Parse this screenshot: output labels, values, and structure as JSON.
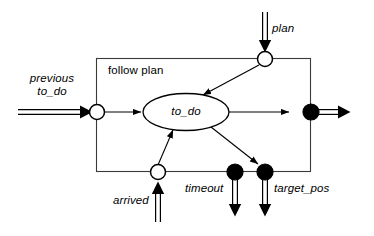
{
  "diagram": {
    "type": "dataflow-state-diagram",
    "container": {
      "name": "follow plan",
      "label": "follow plan",
      "shape": "rectangle"
    },
    "state": {
      "label": "to_do",
      "shape": "ellipse"
    },
    "ports": [
      {
        "id": "previous-to-do",
        "label": "previous\nto_do",
        "label_line1": "previous",
        "label_line2": "to_do",
        "kind": "input",
        "marker": "hollow-circle",
        "side": "left"
      },
      {
        "id": "plan",
        "label": "plan",
        "kind": "input",
        "marker": "hollow-circle",
        "side": "top"
      },
      {
        "id": "arrived",
        "label": "arrived",
        "kind": "input",
        "marker": "hollow-circle",
        "side": "bottom"
      },
      {
        "id": "timeout",
        "label": "timeout",
        "kind": "output",
        "marker": "filled-circle",
        "side": "bottom"
      },
      {
        "id": "target-pos",
        "label": "target_pos",
        "kind": "output",
        "marker": "filled-circle",
        "side": "bottom"
      },
      {
        "id": "right-output",
        "label": "",
        "kind": "output",
        "marker": "filled-circle",
        "side": "right"
      }
    ],
    "colors": {
      "stroke": "#000000",
      "fill_port_input": "#ffffff",
      "fill_port_output": "#000000",
      "background": "#ffffff",
      "box_border": "#3a3a3a"
    }
  }
}
